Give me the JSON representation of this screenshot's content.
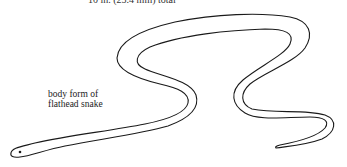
{
  "figure": {
    "top_caption": "10 in. (25.4 mm) total",
    "label_lines": [
      "body form of",
      "flathead snake"
    ],
    "stroke_color": "#1a1a1a",
    "background": "#ffffff"
  }
}
